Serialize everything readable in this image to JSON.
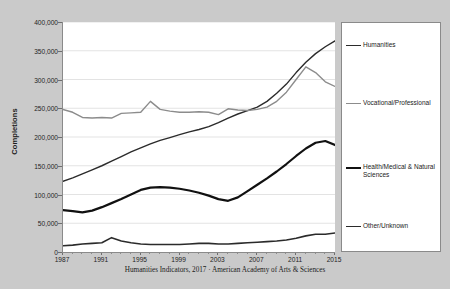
{
  "caption": "Humanities Indicators, 2017 · American Academy of Arts & Sciences",
  "axes": {
    "ylabel": "Completions",
    "xlabel": "",
    "y_ticks": [
      "0",
      "50,000",
      "100,000",
      "150,000",
      "200,000",
      "250,000",
      "300,000",
      "350,000",
      "400,000"
    ],
    "x_ticks": [
      "1987",
      "1991",
      "1995",
      "1999",
      "2003",
      "2007",
      "2011",
      "2015"
    ]
  },
  "legend": {
    "items": [
      {
        "label": "Humanities",
        "color": "#2b2b2b"
      },
      {
        "label": "Vocational/Professional",
        "color": "#8c8c8c"
      },
      {
        "label": "Health/Medical & Natural Sciences",
        "color": "#111111"
      },
      {
        "label": "Other/Unknown",
        "color": "#2b2b2b"
      }
    ]
  },
  "chart_data": {
    "type": "line",
    "title": "",
    "xlabel": "",
    "ylabel": "Completions",
    "xlim": [
      1987,
      2015
    ],
    "ylim": [
      0,
      400000
    ],
    "ytick_step": 50000,
    "grid": true,
    "legend_position": "right",
    "x": [
      1987,
      1988,
      1989,
      1990,
      1991,
      1992,
      1993,
      1994,
      1995,
      1996,
      1997,
      1998,
      1999,
      2000,
      2001,
      2002,
      2003,
      2004,
      2005,
      2006,
      2007,
      2008,
      2009,
      2010,
      2011,
      2012,
      2013,
      2014,
      2015
    ],
    "series": [
      {
        "name": "Humanities",
        "color": "#2b2b2b",
        "width": 1.4,
        "values": [
          123000,
          129000,
          136000,
          143000,
          150000,
          158000,
          166000,
          174000,
          181000,
          188000,
          194000,
          199000,
          204000,
          209000,
          213000,
          218000,
          225000,
          233000,
          240000,
          246000,
          252000,
          262000,
          276000,
          292000,
          312000,
          330000,
          345000,
          357000,
          367000
        ]
      },
      {
        "name": "Vocational/Professional",
        "color": "#8c8c8c",
        "width": 1.4,
        "values": [
          248000,
          243000,
          234000,
          233000,
          234000,
          233000,
          241000,
          242000,
          243000,
          262000,
          248000,
          245000,
          243000,
          243000,
          244000,
          243000,
          239000,
          249000,
          247000,
          246000,
          248000,
          252000,
          262000,
          278000,
          300000,
          322000,
          312000,
          296000,
          288000
        ]
      },
      {
        "name": "Health/Medical & Natural Sciences",
        "color": "#111111",
        "width": 2.2,
        "values": [
          73000,
          71000,
          69000,
          72000,
          78000,
          85000,
          92000,
          100000,
          108000,
          112000,
          113000,
          112000,
          110000,
          107000,
          103000,
          98000,
          92000,
          89000,
          95000,
          106000,
          117000,
          128000,
          140000,
          153000,
          167000,
          180000,
          190000,
          193000,
          186000
        ]
      },
      {
        "name": "Other/Unknown",
        "color": "#2b2b2b",
        "width": 1.6,
        "values": [
          11000,
          12000,
          14000,
          15000,
          16000,
          25000,
          19000,
          16000,
          14000,
          13000,
          13000,
          13000,
          13000,
          14000,
          15000,
          15000,
          14000,
          14000,
          15000,
          16000,
          17000,
          18000,
          19000,
          21000,
          24000,
          28000,
          31000,
          31000,
          33000
        ]
      }
    ]
  }
}
